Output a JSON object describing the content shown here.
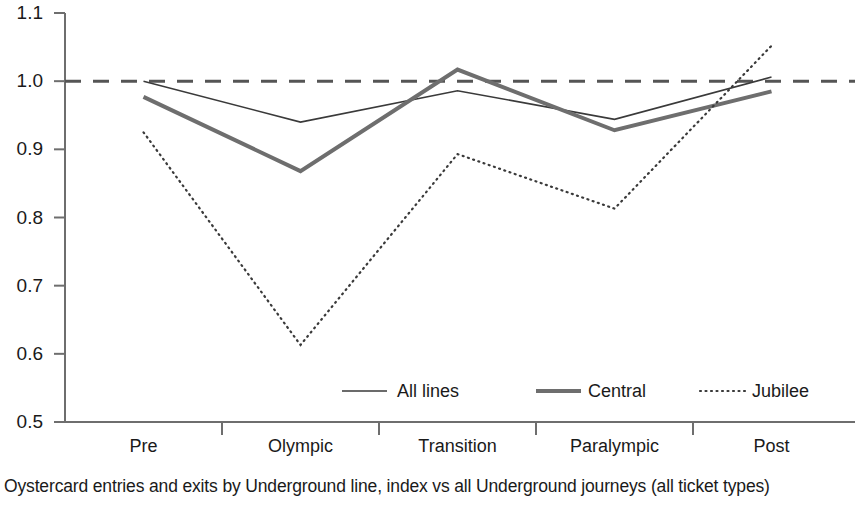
{
  "caption": "Oystercard entries and exits by Underground line, index vs all Underground journeys (all ticket types)",
  "chart_data": {
    "type": "line",
    "title": "",
    "subtitle": "",
    "xlabel": "",
    "ylabel": "",
    "categories": [
      "Pre",
      "Olympic",
      "Transition",
      "Paralympic",
      "Post"
    ],
    "ylim": [
      0.5,
      1.1
    ],
    "yticks": [
      "0.5",
      "0.6",
      "0.7",
      "0.8",
      "0.9",
      "1.0",
      "1.1"
    ],
    "ytick_values": [
      0.5,
      0.6,
      0.7,
      0.8,
      0.9,
      1.0,
      1.1
    ],
    "grid": false,
    "legend_position": "bottom-inside",
    "reference_line": {
      "value": 1.0,
      "style": "dashed",
      "color": "#555555"
    },
    "series": [
      {
        "name": "All lines",
        "style": "solid-thin",
        "color": "#3a3a3a",
        "width": 1.6,
        "values": [
          1.0,
          0.94,
          0.986,
          0.944,
          1.006
        ]
      },
      {
        "name": "Central",
        "style": "solid-thick",
        "color": "#6e6e6e",
        "width": 4.0,
        "values": [
          0.977,
          0.868,
          1.017,
          0.928,
          0.985
        ]
      },
      {
        "name": "Jubilee",
        "style": "dotted",
        "color": "#3a3a3a",
        "width": 2.2,
        "values": [
          0.925,
          0.613,
          0.893,
          0.813,
          1.052
        ]
      }
    ],
    "axis_color": "#6e6e6e"
  }
}
